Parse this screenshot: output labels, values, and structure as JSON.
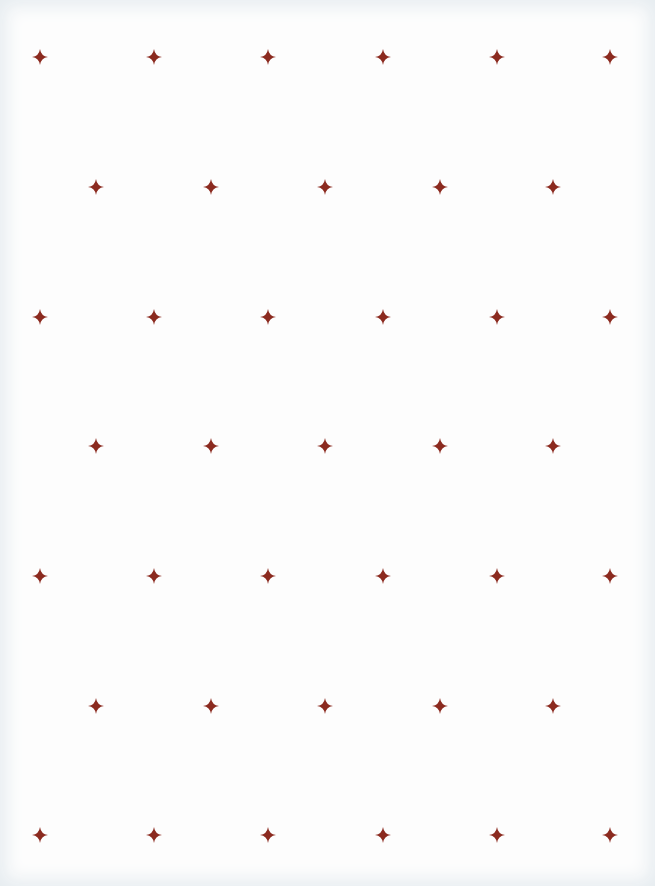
{
  "page": {
    "width": 655,
    "height": 886,
    "background": "#fdfdfd",
    "edge_tint": "#e6ecf0"
  },
  "pattern": {
    "icon": "four-point-star-icon",
    "color": "#8b2a1f",
    "size": 16,
    "rows": [
      {
        "y": 57,
        "xs": [
          40,
          154,
          268,
          383,
          497,
          610
        ]
      },
      {
        "y": 187,
        "xs": [
          96,
          211,
          325,
          440,
          553
        ]
      },
      {
        "y": 317,
        "xs": [
          40,
          154,
          268,
          383,
          497,
          610
        ]
      },
      {
        "y": 446,
        "xs": [
          96,
          211,
          325,
          440,
          553
        ]
      },
      {
        "y": 576,
        "xs": [
          40,
          154,
          268,
          383,
          497,
          610
        ]
      },
      {
        "y": 706,
        "xs": [
          96,
          211,
          325,
          440,
          553
        ]
      },
      {
        "y": 835,
        "xs": [
          40,
          154,
          268,
          383,
          497,
          610
        ]
      }
    ]
  }
}
